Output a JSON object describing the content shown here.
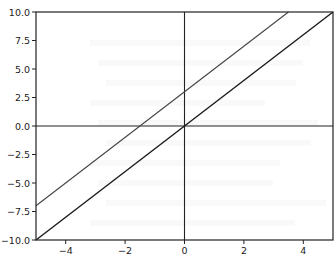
{
  "chart_data": {
    "type": "line",
    "title": "",
    "xlabel": "",
    "ylabel": "",
    "xlim": [
      -5,
      5
    ],
    "ylim": [
      -10,
      10
    ],
    "grid": false,
    "legend": null,
    "x_ticks": [
      -4,
      -2,
      0,
      2,
      4
    ],
    "x_tick_labels": [
      "−4",
      "−2",
      "0",
      "2",
      "4"
    ],
    "y_ticks": [
      10,
      7.5,
      5,
      2.5,
      0,
      -2.5,
      -5,
      -7.5,
      -10
    ],
    "y_tick_labels": [
      "10.0",
      "7.5",
      "5.0",
      "2.5",
      "0.0",
      "−2.5",
      "−5.0",
      "−7.5",
      "−10.0"
    ],
    "reference_lines": [
      {
        "orientation": "horizontal",
        "value": 0
      },
      {
        "orientation": "vertical",
        "value": 0
      }
    ],
    "series": [
      {
        "name": "y = 2x + 3",
        "equation": "y = 2x + 3",
        "x": [
          -5,
          3.5
        ],
        "y": [
          -7,
          10
        ],
        "color": "#444444",
        "width": 1.1
      },
      {
        "name": "y = 2x",
        "equation": "y = 2x",
        "x": [
          -5,
          5
        ],
        "y": [
          -10,
          10
        ],
        "color": "#1a1a1a",
        "width": 1.4
      }
    ]
  },
  "colors": {
    "axes": "#222222",
    "background": "#ffffff"
  }
}
